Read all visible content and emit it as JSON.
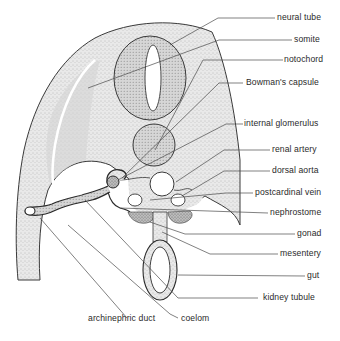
{
  "figure": {
    "labels": [
      {
        "id": "neural-tube",
        "text": "neural tube"
      },
      {
        "id": "somite",
        "text": "somite"
      },
      {
        "id": "notochord",
        "text": "notochord"
      },
      {
        "id": "bowmans-capsule",
        "text": "Bowman's capsule"
      },
      {
        "id": "internal-glomerulus",
        "text": "internal glomerulus"
      },
      {
        "id": "renal-artery",
        "text": "renal artery"
      },
      {
        "id": "dorsal-aorta",
        "text": "dorsal aorta"
      },
      {
        "id": "postcardinal-vein",
        "text": "postcardinal vein"
      },
      {
        "id": "nephrostome",
        "text": "nephrostome"
      },
      {
        "id": "gonad",
        "text": "gonad"
      },
      {
        "id": "mesentery",
        "text": "mesentery"
      },
      {
        "id": "gut",
        "text": "gut"
      },
      {
        "id": "kidney-tubule",
        "text": "kidney tubule"
      },
      {
        "id": "archinephric-duct",
        "text": "archinephric duct"
      },
      {
        "id": "coelom",
        "text": "coelom"
      }
    ]
  }
}
